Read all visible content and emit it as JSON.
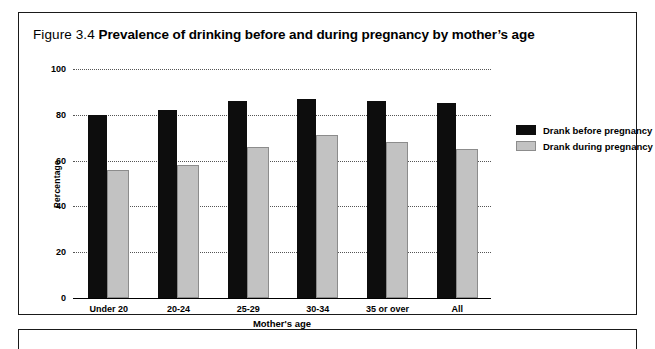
{
  "figure": {
    "number": "Figure 3.4",
    "caption": "Prevalence of drinking before and during pregnancy by mother’s age"
  },
  "legend": {
    "position": "right",
    "items": [
      {
        "label": "Drank before pregnancy",
        "color": "#0d0d0d",
        "icon": "legend-swatch-black"
      },
      {
        "label": "Drank during pregnancy",
        "color": "#c2c2c2",
        "icon": "legend-swatch-gray"
      }
    ]
  },
  "chart_data": {
    "type": "bar",
    "title": "Prevalence of drinking before and during pregnancy by mother’s age",
    "xlabel": "Mother's age",
    "ylabel": "Percentage",
    "ylim": [
      0,
      100
    ],
    "yticks": [
      0,
      20,
      40,
      60,
      80,
      100
    ],
    "ytick_labels": [
      "0",
      "20",
      "40",
      "60",
      "80",
      "100"
    ],
    "grid": true,
    "grid_style": "dotted-horizontal",
    "legend_position": "right",
    "categories": [
      "Under 20",
      "20-24",
      "25-29",
      "30-34",
      "35 or over",
      "All"
    ],
    "series": [
      {
        "name": "Drank before pregnancy",
        "color": "#0d0d0d",
        "values": [
          80,
          82,
          86,
          87,
          86,
          85
        ]
      },
      {
        "name": "Drank during pregnancy",
        "color": "#c2c2c2",
        "values": [
          56,
          58,
          66,
          71,
          68,
          65
        ]
      }
    ]
  }
}
